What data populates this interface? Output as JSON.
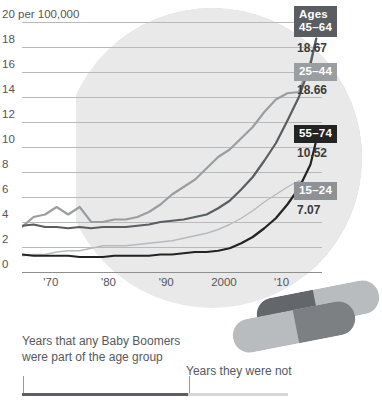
{
  "chart_data": {
    "type": "line",
    "title": "",
    "subtitle": "",
    "xlabel": "",
    "ylabel": "20 per 100,000",
    "ylim": [
      0,
      20
    ],
    "ytick_step": 2,
    "ytick_labels": [
      "20 per 100,000",
      "18",
      "16",
      "14",
      "12",
      "10",
      "8",
      "6",
      "4",
      "2",
      "0"
    ],
    "ytick_values": [
      20,
      18,
      16,
      14,
      12,
      10,
      8,
      6,
      4,
      2,
      0
    ],
    "xlim": [
      1965,
      2017
    ],
    "xtick_labels": [
      "'70",
      "'80",
      "'90",
      "2000",
      "'10"
    ],
    "xtick_values": [
      1970,
      1980,
      1990,
      2000,
      2010
    ],
    "grid": true,
    "legend_position": "right-inline-end-labels",
    "series": [
      {
        "name": "45–64",
        "label": "Ages\n45–64",
        "badge_label_line1": "Ages",
        "badge_label_line2": "45–64",
        "end_value": "18.67",
        "color": "#5a5d61",
        "badge_color": "#5a5d61",
        "x": [
          1965,
          1967,
          1969,
          1971,
          1973,
          1975,
          1977,
          1979,
          1981,
          1983,
          1985,
          1987,
          1989,
          1991,
          1993,
          1995,
          1997,
          1999,
          2001,
          2003,
          2005,
          2007,
          2009,
          2011,
          2013,
          2015,
          2016
        ],
        "values": [
          3.7,
          3.8,
          3.6,
          3.6,
          3.5,
          3.6,
          3.5,
          3.6,
          3.6,
          3.6,
          3.7,
          3.8,
          4.0,
          4.1,
          4.2,
          4.4,
          4.6,
          5.1,
          5.7,
          6.6,
          7.6,
          8.9,
          10.3,
          12.1,
          14.0,
          16.6,
          18.67
        ]
      },
      {
        "name": "25–44",
        "label": "25–44",
        "badge_label_line1": "25–44",
        "badge_label_line2": "",
        "end_value": "18.66",
        "color": "#9b9ea1",
        "badge_color": "#9b9ea1",
        "x": [
          1965,
          1967,
          1969,
          1971,
          1973,
          1975,
          1977,
          1979,
          1981,
          1983,
          1985,
          1987,
          1989,
          1991,
          1993,
          1995,
          1997,
          1999,
          2001,
          2003,
          2005,
          2007,
          2009,
          2011,
          2013,
          2015,
          2016
        ],
        "values": [
          3.6,
          4.4,
          4.6,
          5.2,
          4.6,
          5.2,
          4.0,
          4.0,
          4.2,
          4.2,
          4.4,
          4.8,
          5.4,
          6.2,
          6.8,
          7.4,
          8.3,
          9.2,
          9.8,
          10.7,
          11.6,
          12.8,
          13.8,
          14.3,
          14.4,
          16.8,
          18.66
        ]
      },
      {
        "name": "55–74",
        "label": "55–74",
        "badge_label_line1": "55–74",
        "badge_label_line2": "",
        "end_value": "10.52",
        "color": "#232323",
        "badge_color": "#232323",
        "x": [
          1965,
          1967,
          1969,
          1971,
          1973,
          1975,
          1977,
          1979,
          1981,
          1983,
          1985,
          1987,
          1989,
          1991,
          1993,
          1995,
          1997,
          1999,
          2001,
          2003,
          2005,
          2007,
          2009,
          2011,
          2013,
          2015,
          2016
        ],
        "values": [
          1.4,
          1.3,
          1.3,
          1.3,
          1.3,
          1.2,
          1.2,
          1.2,
          1.3,
          1.3,
          1.3,
          1.3,
          1.4,
          1.4,
          1.5,
          1.6,
          1.6,
          1.7,
          1.9,
          2.3,
          2.8,
          3.5,
          4.3,
          5.4,
          6.7,
          8.6,
          10.52
        ]
      },
      {
        "name": "15–24",
        "label": "15–24",
        "badge_label_line1": "15–24",
        "badge_label_line2": "",
        "end_value": "7.07",
        "color": "#b7babd",
        "badge_color": "#8e9195",
        "x": [
          1965,
          1967,
          1969,
          1971,
          1973,
          1975,
          1977,
          1979,
          1981,
          1983,
          1985,
          1987,
          1989,
          1991,
          1993,
          1995,
          1997,
          1999,
          2001,
          2003,
          2005,
          2007,
          2009,
          2011,
          2013,
          2015,
          2016
        ],
        "values": [
          1.3,
          1.4,
          1.4,
          1.6,
          1.7,
          1.7,
          1.9,
          2.1,
          2.1,
          2.1,
          2.2,
          2.3,
          2.4,
          2.5,
          2.7,
          2.9,
          3.1,
          3.4,
          3.8,
          4.3,
          4.9,
          5.6,
          6.2,
          6.8,
          7.3,
          6.9,
          7.07
        ]
      }
    ]
  },
  "footer": {
    "note_included": "Years that any Baby Boomers\nwere part of the age group",
    "note_excluded": "Years they were not"
  },
  "colors": {
    "accent_dark": "#232323",
    "series_45_64": "#5a5d61",
    "series_25_44": "#9b9ea1",
    "series_55_74": "#232323",
    "series_15_24": "#b7babd",
    "background_circle": "#e9e9e9",
    "background_arc": "#d2d2d2",
    "capsule_light": "#b9bcbe",
    "capsule_dark": "#7d8083",
    "capsule_darkest": "#63666a",
    "legend_bar_fill": "#5c5f63",
    "legend_bar_track": "#d6d6d6"
  },
  "capsules": [
    {
      "name": "capsule-upper",
      "light": "#b9bcbe",
      "dark": "#63666a"
    },
    {
      "name": "capsule-lower",
      "light": "#b9bcbe",
      "dark": "#8d9093"
    }
  ]
}
